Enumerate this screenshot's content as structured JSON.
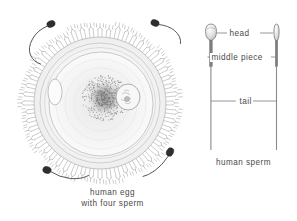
{
  "figure": {
    "background_color": "#ffffff",
    "ink_color": "#4a4a4a",
    "style": "pen-and-ink line drawing"
  },
  "egg_panel": {
    "caption_line1": "human egg",
    "caption_line2": "with four sperm",
    "structures": [
      {
        "name": "corona-radiata",
        "label": "corona radiata cells"
      },
      {
        "name": "zona-pellucida",
        "label": "zona pellucida"
      },
      {
        "name": "ooplasm",
        "label": "ooplasm"
      },
      {
        "name": "nucleus",
        "label": "nucleus"
      },
      {
        "name": "centrosome-stipple",
        "label": "dark stippled mass"
      },
      {
        "name": "polar-body",
        "label": "polar body"
      }
    ],
    "sperm_count": 4,
    "sperm_positions": [
      "upper-left",
      "upper-right",
      "lower-left",
      "lower-right"
    ]
  },
  "sperm_panel": {
    "caption": "human sperm",
    "labels": {
      "head": "head",
      "middle_piece": "middle piece",
      "tail": "tail"
    },
    "views": [
      {
        "name": "flat-view",
        "label": "flat view"
      },
      {
        "name": "edge-view",
        "label": "edge view"
      }
    ]
  }
}
